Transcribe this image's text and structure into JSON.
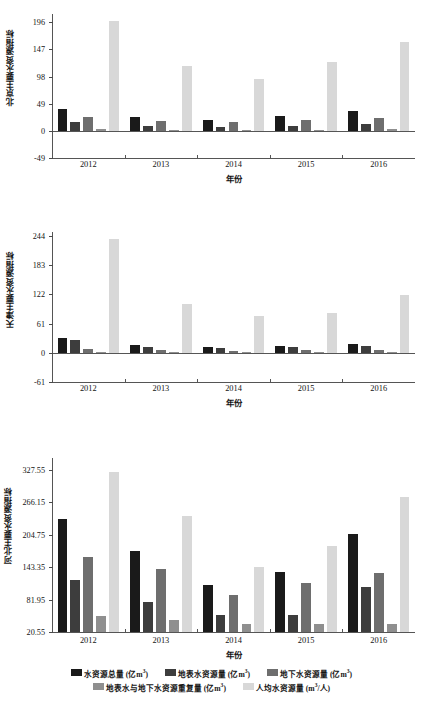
{
  "chart_data": [
    {
      "type": "bar",
      "title": "",
      "ylabel": "北京主要水资源指标",
      "xlabel": "年份",
      "categories": [
        "2012",
        "2013",
        "2014",
        "2015",
        "2016"
      ],
      "yticks": [
        196,
        147,
        98,
        49,
        0,
        -49
      ],
      "ylim": [
        -49,
        211
      ],
      "grid": false,
      "series": [
        {
          "name": "水资源总量 (亿m³)",
          "color": "#1a1a1a",
          "values": [
            39.5,
            24.8,
            20.0,
            26.8,
            35.1
          ]
        },
        {
          "name": "地表水资源量 (亿m³)",
          "color": "#3d3d3d",
          "values": [
            16.6,
            8.8,
            6.3,
            8.8,
            12.4
          ]
        },
        {
          "name": "地下水资源量 (亿m³)",
          "color": "#6e6e6e",
          "values": [
            24.5,
            17.1,
            15.4,
            19.3,
            22.7
          ]
        },
        {
          "name": "地表水与地下水资源重复量 (亿m³)",
          "color": "#8f8f8f",
          "values": [
            3.5,
            2.4,
            1.8,
            2.2,
            3.0
          ]
        },
        {
          "name": "人均水资源量 (m³/人)",
          "color": "#d8d8d8",
          "values": [
            199.0,
            118.0,
            94.0,
            124.0,
            161.0
          ]
        }
      ]
    },
    {
      "type": "bar",
      "title": "",
      "ylabel": "天津主要水资源指标",
      "xlabel": "年份",
      "categories": [
        "2012",
        "2013",
        "2014",
        "2015",
        "2016"
      ],
      "yticks": [
        244,
        183,
        122,
        61,
        0,
        -61
      ],
      "ylim": [
        -61,
        252
      ],
      "grid": false,
      "series": [
        {
          "name": "水资源总量 (亿m³)",
          "color": "#1a1a1a",
          "values": [
            31.2,
            16.2,
            12.8,
            14.0,
            18.8
          ]
        },
        {
          "name": "地表水资源量 (亿m³)",
          "color": "#3d3d3d",
          "values": [
            25.9,
            12.8,
            10.2,
            11.1,
            14.6
          ]
        },
        {
          "name": "地下水资源量 (亿m³)",
          "color": "#6e6e6e",
          "values": [
            8.1,
            5.6,
            4.4,
            5.2,
            6.2
          ]
        },
        {
          "name": "地表水与地下水资源重复量 (亿m³)",
          "color": "#8f8f8f",
          "values": [
            1.6,
            1.3,
            1.0,
            1.2,
            1.4
          ]
        },
        {
          "name": "人均水资源量 (m³/人)",
          "color": "#d8d8d8",
          "values": [
            238.0,
            102.0,
            77.0,
            82.0,
            121.0
          ]
        }
      ]
    },
    {
      "type": "bar",
      "title": "",
      "ylabel": "河北主要水资源指标",
      "xlabel": "年份",
      "categories": [
        "2012",
        "2013",
        "2014",
        "2015",
        "2016"
      ],
      "yticks": [
        327.55,
        266.15,
        204.75,
        143.35,
        81.95,
        20.55
      ],
      "ylim": [
        20.55,
        350.0
      ],
      "grid": false,
      "series": [
        {
          "name": "水资源总量 (亿m³)",
          "color": "#1a1a1a",
          "values": [
            234.0,
            174.0,
            110.0,
            135.0,
            206.0
          ]
        },
        {
          "name": "地表水资源量 (亿m³)",
          "color": "#3d3d3d",
          "values": [
            119.0,
            78.0,
            52.0,
            53.0,
            105.0
          ]
        },
        {
          "name": "地下水资源量 (亿m³)",
          "color": "#6e6e6e",
          "values": [
            163.0,
            139.0,
            91.0,
            114.0,
            133.0
          ]
        },
        {
          "name": "地表水与地下水资源重复量 (亿m³)",
          "color": "#8f8f8f",
          "values": [
            50.0,
            44.0,
            35.0,
            35.0,
            35.0
          ]
        },
        {
          "name": "人均水资源量 (m³/人)",
          "color": "#d8d8d8",
          "values": [
            324.0,
            240.0,
            144.0,
            183.0,
            277.0
          ]
        }
      ]
    }
  ],
  "legend": {
    "position": "bottom",
    "rows": [
      [
        {
          "label_pre": "水资源总量 (亿m",
          "sup": "3",
          "label_post": ")",
          "color": "#1a1a1a"
        },
        {
          "label_pre": "地表水资源量 (亿m",
          "sup": "3",
          "label_post": ")",
          "color": "#3d3d3d"
        },
        {
          "label_pre": "地下水资源量 (亿m",
          "sup": "3",
          "label_post": ")",
          "color": "#6e6e6e"
        }
      ],
      [
        {
          "label_pre": "地表水与地下水资源重复量 (亿m",
          "sup": "3",
          "label_post": ")",
          "color": "#8f8f8f"
        },
        {
          "label_pre": "人均水资源量 (m",
          "sup": "3",
          "label_post": "/人)",
          "color": "#d8d8d8"
        }
      ]
    ]
  }
}
